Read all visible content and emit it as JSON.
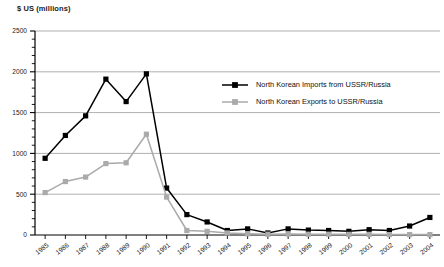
{
  "chart_data": {
    "type": "line",
    "title": "$ US (millions)",
    "xlabel": "",
    "ylabel": "$ US (millions)",
    "ylim": [
      0,
      2500
    ],
    "yticks": [
      0,
      500,
      1000,
      1500,
      2000,
      2500
    ],
    "ytick_labels": [
      "0",
      "500",
      "1000",
      "1500",
      "2000",
      "2500"
    ],
    "y_minor_tick_interval": 100,
    "grid": "horizontal",
    "legend_position": "inside-upper-right",
    "categories": [
      "1985",
      "1986",
      "1987",
      "1988",
      "1989",
      "1990",
      "1991",
      "1992",
      "1993",
      "1994",
      "1995",
      "1996",
      "1997",
      "1998",
      "1999",
      "2000",
      "2001",
      "2002",
      "2003",
      "2004"
    ],
    "series": [
      {
        "name": "North Korean Imports from USSR/Russia",
        "color": "#000000",
        "marker": "square",
        "values": [
          940,
          1220,
          1460,
          1910,
          1635,
          1975,
          575,
          250,
          160,
          55,
          75,
          25,
          75,
          60,
          55,
          45,
          65,
          55,
          110,
          215
        ]
      },
      {
        "name": "North Korean Exports to USSR/Russia",
        "color": "#aaaaaa",
        "marker": "square",
        "values": [
          520,
          655,
          710,
          875,
          885,
          1235,
          465,
          55,
          45,
          25,
          15,
          10,
          12,
          10,
          10,
          8,
          8,
          5,
          5,
          5
        ]
      }
    ]
  },
  "legend": {
    "items": [
      {
        "label": "North Korean Imports from USSR/Russia",
        "color": "#000000"
      },
      {
        "label": "North Korean Exports to USSR/Russia",
        "color": "#aaaaaa"
      }
    ]
  },
  "colors": {
    "imports": "#000000",
    "exports": "#aaaaaa",
    "gridline": "#9a9a9a",
    "axis": "#000000",
    "background": "#ffffff"
  }
}
